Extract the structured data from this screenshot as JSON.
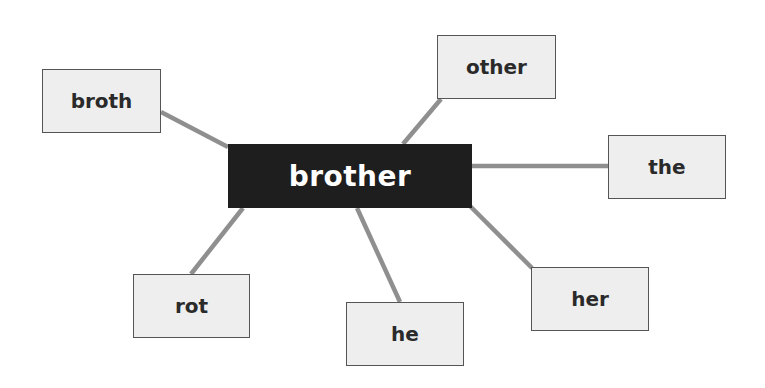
{
  "diagram": {
    "type": "word-web",
    "center": {
      "label": "brother",
      "x": 228,
      "y": 144,
      "w": 244,
      "h": 64
    },
    "nodes": [
      {
        "id": "broth",
        "label": "broth",
        "x": 42,
        "y": 69,
        "w": 119,
        "h": 64,
        "link": [
          161,
          112,
          228,
          147
        ]
      },
      {
        "id": "other",
        "label": "other",
        "x": 437,
        "y": 35,
        "w": 119,
        "h": 64,
        "link": [
          441,
          99,
          403,
          144
        ]
      },
      {
        "id": "the",
        "label": "the",
        "x": 608,
        "y": 135,
        "w": 118,
        "h": 64,
        "link": [
          472,
          166,
          608,
          166
        ]
      },
      {
        "id": "rot",
        "label": "rot",
        "x": 133,
        "y": 274,
        "w": 117,
        "h": 64,
        "link": [
          243,
          208,
          191,
          274
        ]
      },
      {
        "id": "he",
        "label": "he",
        "x": 346,
        "y": 302,
        "w": 118,
        "h": 64,
        "link": [
          357,
          208,
          400,
          302
        ]
      },
      {
        "id": "her",
        "label": "her",
        "x": 531,
        "y": 267,
        "w": 118,
        "h": 64,
        "link": [
          470,
          206,
          532,
          268
        ]
      }
    ]
  },
  "colors": {
    "center_fill": "#1e1e1e",
    "center_text": "#ffffff",
    "leaf_fill": "#eeeeee",
    "leaf_border": "#555555",
    "leaf_text": "#2a2a2a",
    "connector": "#8f8f8f"
  }
}
